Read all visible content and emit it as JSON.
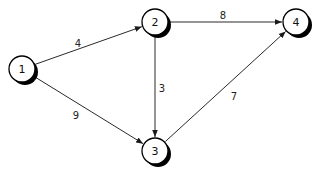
{
  "diagram": {
    "type": "weighted directed graph",
    "nodes": [
      {
        "id": "1",
        "label": "1"
      },
      {
        "id": "2",
        "label": "2"
      },
      {
        "id": "3",
        "label": "3"
      },
      {
        "id": "4",
        "label": "4"
      }
    ],
    "edges": [
      {
        "from": "1",
        "to": "2",
        "weight": "4"
      },
      {
        "from": "1",
        "to": "3",
        "weight": "9"
      },
      {
        "from": "2",
        "to": "4",
        "weight": "8"
      },
      {
        "from": "2",
        "to": "3",
        "weight": "3"
      },
      {
        "from": "3",
        "to": "4",
        "weight": "7"
      }
    ],
    "colors": {
      "node_fill": "#ffffff",
      "node_stroke": "#000000",
      "shadow": "#000000",
      "edge": "#2a2a2a",
      "background": "#ffffff"
    }
  }
}
